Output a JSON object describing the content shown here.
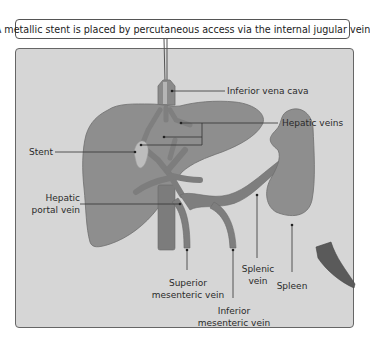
{
  "title": "A metallic stent is placed by percutaneous access via the internal jugular vein",
  "labels": {
    "ivc": "Inferior vena cava",
    "hepatic_veins": "Hepatic veins",
    "stent": "Stent",
    "hepatic_portal_vein_1": "Hepatic",
    "hepatic_portal_vein_2": "portal vein",
    "superior_mesenteric_1": "Superior",
    "superior_mesenteric_2": "mesenteric vein",
    "inferior_mesenteric_1": "Inferior",
    "inferior_mesenteric_2": "mesenteric vein",
    "splenic_1": "Splenic",
    "splenic_2": "vein",
    "spleen": "Spleen"
  },
  "colors": {
    "panel_bg": "#d6d6d6",
    "organ": "#8c8c8c",
    "organ_outline": "#6e6e6e",
    "vein": "#7a7a7a",
    "stent": "#bdbdbd",
    "leader": "#333333"
  }
}
